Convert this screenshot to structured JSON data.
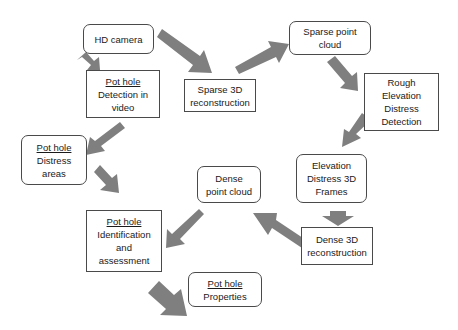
{
  "diagram": {
    "type": "flowchart",
    "arrow_color": "#7f7f7f",
    "nodes": {
      "hd_camera": {
        "shape": "rounded",
        "lines": [
          "HD camera"
        ]
      },
      "detection_video": {
        "shape": "rect",
        "underlined": "Pot hole",
        "lines": [
          "Detection in",
          "video"
        ]
      },
      "sparse_3d": {
        "shape": "rect",
        "lines": [
          "Sparse 3D",
          "reconstruction"
        ]
      },
      "sparse_cloud": {
        "shape": "rounded",
        "lines": [
          "Sparse point",
          "cloud"
        ]
      },
      "rough_detection": {
        "shape": "rect",
        "lines": [
          "Rough",
          "Elevation",
          "Distress",
          "Detection"
        ]
      },
      "distress_areas": {
        "shape": "rounded",
        "underlined": "Pot hole",
        "lines": [
          "Distress",
          "areas"
        ]
      },
      "elevation_frames": {
        "shape": "rounded",
        "lines": [
          "Elevation",
          "Distress 3D",
          "Frames"
        ]
      },
      "dense_cloud": {
        "shape": "rounded",
        "lines": [
          "Dense",
          "point cloud"
        ]
      },
      "dense_3d": {
        "shape": "rect",
        "lines": [
          "Dense 3D",
          "reconstruction"
        ]
      },
      "identification": {
        "shape": "rect",
        "underlined": "Pot hole",
        "lines": [
          "Identification",
          "and",
          "assessment"
        ]
      },
      "properties": {
        "shape": "rounded",
        "underlined": "Pot hole",
        "lines": [
          "Properties"
        ]
      }
    },
    "edges": [
      {
        "from": "hd_camera",
        "to": "detection_video"
      },
      {
        "from": "hd_camera",
        "to": "sparse_3d"
      },
      {
        "from": "sparse_3d",
        "to": "sparse_cloud"
      },
      {
        "from": "sparse_cloud",
        "to": "rough_detection"
      },
      {
        "from": "rough_detection",
        "to": "elevation_frames"
      },
      {
        "from": "elevation_frames",
        "to": "dense_3d"
      },
      {
        "from": "dense_3d",
        "to": "dense_cloud"
      },
      {
        "from": "dense_cloud",
        "to": "identification"
      },
      {
        "from": "detection_video",
        "to": "distress_areas"
      },
      {
        "from": "distress_areas",
        "to": "identification"
      },
      {
        "from": "identification",
        "to": "properties"
      }
    ]
  }
}
